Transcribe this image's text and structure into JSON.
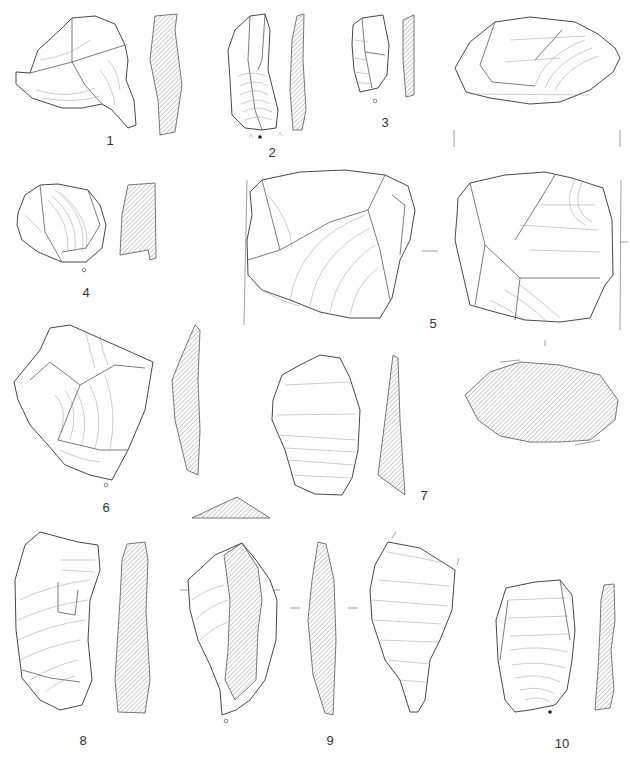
{
  "plate": {
    "type": "lithic artifact illustration plate",
    "figures": [
      {
        "number": "1",
        "label_x": 110,
        "label_y": 133,
        "views": [
          "dorsal",
          "section"
        ]
      },
      {
        "number": "2",
        "label_x": 272,
        "label_y": 147,
        "views": [
          "dorsal",
          "section"
        ],
        "marker": "filled-dot"
      },
      {
        "number": "3",
        "label_x": 385,
        "label_y": 117,
        "views": [
          "dorsal",
          "section"
        ],
        "marker": "open-dot"
      },
      {
        "number": "4",
        "label_x": 86,
        "label_y": 287,
        "views": [
          "dorsal",
          "section"
        ],
        "marker": "open-dot"
      },
      {
        "number": "5",
        "label_x": 433,
        "label_y": 318,
        "views": [
          "platform",
          "face-a",
          "face-b",
          "section"
        ]
      },
      {
        "number": "6",
        "label_x": 106,
        "label_y": 472,
        "views": [
          "dorsal",
          "section",
          "cross-section"
        ],
        "marker": "open-dot"
      },
      {
        "number": "7",
        "label_x": 424,
        "label_y": 490,
        "views": [
          "dorsal",
          "section"
        ]
      },
      {
        "number": "8",
        "label_x": 83,
        "label_y": 735,
        "views": [
          "dorsal",
          "section"
        ]
      },
      {
        "number": "9",
        "label_x": 330,
        "label_y": 735,
        "views": [
          "dorsal",
          "section",
          "ventral"
        ],
        "marker": "open-dot"
      },
      {
        "number": "10",
        "label_x": 562,
        "label_y": 738,
        "views": [
          "dorsal",
          "section"
        ],
        "marker": "filled-dot"
      }
    ]
  },
  "colors": {
    "background": "#ffffff",
    "line": "#333333",
    "ripple": "#9a9a9a",
    "hatch": "#777777"
  }
}
